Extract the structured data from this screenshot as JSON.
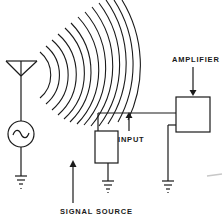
{
  "diagram": {
    "type": "schematic",
    "labels": {
      "amplifier": "AMPLIFIER",
      "input": "INPUT",
      "signal_source": "SIGNAL SOURCE"
    },
    "components": [
      {
        "id": "antenna",
        "icon": "antenna-icon"
      },
      {
        "id": "ac-source",
        "icon": "ac-source-icon"
      },
      {
        "id": "radio-waves",
        "icon": "radio-waves-icon"
      },
      {
        "id": "signal-source-box",
        "label_ref": "signal_source"
      },
      {
        "id": "amplifier-box",
        "label_ref": "amplifier"
      },
      {
        "id": "ground-antenna",
        "icon": "ground-icon"
      },
      {
        "id": "ground-signal-source",
        "icon": "ground-icon"
      },
      {
        "id": "ground-amplifier",
        "icon": "ground-icon"
      }
    ],
    "connections": [
      {
        "from": "antenna",
        "to": "ac-source"
      },
      {
        "from": "ac-source",
        "to": "ground-antenna"
      },
      {
        "from": "signal-source-box",
        "to": "amplifier-box",
        "label_ref": "input"
      },
      {
        "from": "signal-source-box",
        "to": "ground-signal-source"
      },
      {
        "from": "amplifier-box",
        "to": "ground-amplifier"
      }
    ],
    "colors": {
      "line": "#1a1a1a",
      "background": "#ffffff"
    }
  }
}
